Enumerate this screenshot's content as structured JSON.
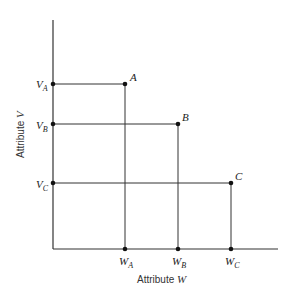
{
  "axes": {
    "x_label_prefix": "Attribute ",
    "x_label_var": "W",
    "y_label_prefix": "Attribute ",
    "y_label_var": "V"
  },
  "points": [
    {
      "name": "A",
      "v_label": "V",
      "v_sub": "A",
      "w_label": "W",
      "w_sub": "A"
    },
    {
      "name": "B",
      "v_label": "V",
      "v_sub": "B",
      "w_label": "W",
      "w_sub": "B"
    },
    {
      "name": "C",
      "v_label": "V",
      "v_sub": "C",
      "w_label": "W",
      "w_sub": "C"
    }
  ],
  "colors": {
    "line": "#333333",
    "dot": "#111111"
  }
}
